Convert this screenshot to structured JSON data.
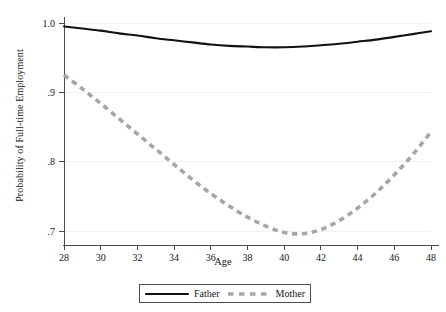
{
  "chart_data": {
    "type": "line",
    "title": "",
    "xlabel": "Age",
    "ylabel": "Probability of Full-time Employment",
    "xlim": [
      28,
      48
    ],
    "ylim": [
      0.69,
      1.005
    ],
    "xticks": [
      28,
      30,
      32,
      34,
      36,
      38,
      40,
      42,
      44,
      46,
      48
    ],
    "xtick_labels": [
      "28",
      "30",
      "32",
      "34",
      "36",
      "38",
      "40",
      "42",
      "44",
      "46",
      "48"
    ],
    "yticks": [
      0.7,
      0.8,
      0.9,
      1.0
    ],
    "ytick_labels": [
      ".7",
      ".8",
      ".9",
      "1.0"
    ],
    "grid": "horizontal-faint",
    "legend_position": "bottom-center",
    "x": [
      28,
      29,
      30,
      31,
      32,
      33,
      34,
      35,
      36,
      37,
      38,
      39,
      40,
      41,
      42,
      43,
      44,
      45,
      46,
      47,
      48
    ],
    "series": [
      {
        "name": "Father",
        "style": "solid",
        "color": "#111111",
        "values": [
          0.995,
          0.992,
          0.989,
          0.985,
          0.982,
          0.978,
          0.975,
          0.972,
          0.969,
          0.967,
          0.966,
          0.965,
          0.965,
          0.966,
          0.968,
          0.97,
          0.973,
          0.976,
          0.98,
          0.984,
          0.988
        ]
      },
      {
        "name": "Mother",
        "style": "dashed",
        "color": "#a6a6a6",
        "values": [
          0.925,
          0.905,
          0.884,
          0.862,
          0.84,
          0.818,
          0.796,
          0.774,
          0.754,
          0.736,
          0.72,
          0.707,
          0.698,
          0.696,
          0.702,
          0.715,
          0.733,
          0.755,
          0.781,
          0.81,
          0.843
        ]
      }
    ]
  },
  "legend": {
    "items": [
      {
        "label": "Father",
        "style": "solid",
        "color": "#111111"
      },
      {
        "label": "Mother",
        "style": "dashed",
        "color": "#a6a6a6"
      }
    ]
  }
}
